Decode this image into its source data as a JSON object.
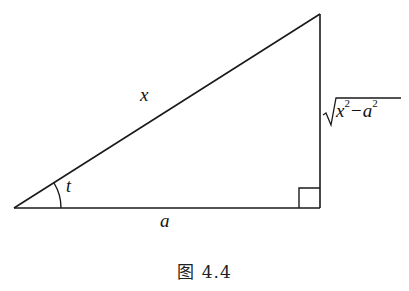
{
  "figure": {
    "caption": "图 4.4",
    "shape": "right-triangle",
    "vertices": {
      "bottom_left": [
        14,
        208
      ],
      "bottom_right": [
        320,
        208
      ],
      "top_right": [
        320,
        14
      ]
    },
    "labels": {
      "hypotenuse": "x",
      "angle": "t",
      "base": "a",
      "vertical_side": {
        "base_var": "x",
        "exp1": "2",
        "operator": "−",
        "sub_var": "a",
        "exp2": "2",
        "text": "√(x²−a²)"
      }
    },
    "right_angle_marker": true,
    "angle_arc": true,
    "stroke_color": "#1a1a1a",
    "background": "#ffffff"
  }
}
